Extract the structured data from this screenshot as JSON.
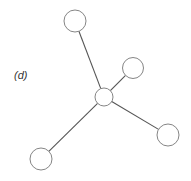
{
  "diagram": {
    "label": "(d)",
    "label_pos": [
      14,
      69
    ],
    "stroke_color": "#555555",
    "fill_color": "#ffffff",
    "hub": {
      "id": "center",
      "cx": 104,
      "cy": 97,
      "r": 9
    },
    "nodes": [
      {
        "id": "top",
        "cx": 75,
        "cy": 21,
        "r": 11
      },
      {
        "id": "upper-right",
        "cx": 133,
        "cy": 68,
        "r": 10.5
      },
      {
        "id": "lower-right",
        "cx": 168,
        "cy": 135,
        "r": 11
      },
      {
        "id": "bottom-left",
        "cx": 41,
        "cy": 159,
        "r": 11
      }
    ]
  }
}
